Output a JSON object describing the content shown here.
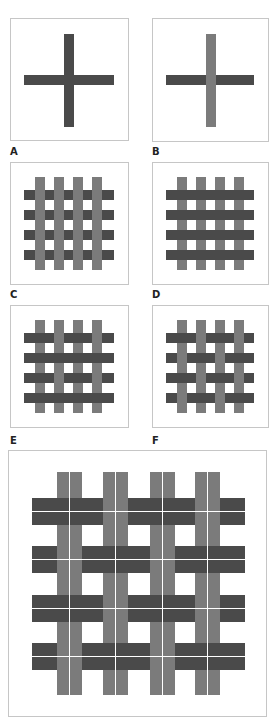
{
  "colors": {
    "dark": "#4a4a4a",
    "light": "#7b7b7b",
    "border": "#c6c6c6",
    "background": "#ffffff"
  },
  "panels": [
    {
      "id": "A",
      "label": "A",
      "box": [
        10,
        18,
        119,
        123
      ],
      "label_pos": [
        10,
        147
      ],
      "description": "single crossing, horizontal and vertical both dark",
      "verticals": [
        {
          "x": 64,
          "w": 10,
          "y": 34,
          "h": 93,
          "color": "dark"
        }
      ],
      "horizontals": [
        {
          "y": 75,
          "h": 10,
          "x": 24,
          "w": 90,
          "color": "dark"
        }
      ],
      "over": [
        [
          "dark-h"
        ]
      ]
    },
    {
      "id": "B",
      "label": "B",
      "box": [
        152,
        18,
        117,
        124
      ],
      "label_pos": [
        152,
        147
      ],
      "description": "single crossing, light vertical over dark horizontal",
      "verticals": [
        {
          "x": 206,
          "w": 10,
          "y": 34,
          "h": 93,
          "color": "light"
        }
      ],
      "horizontals": [
        {
          "y": 75,
          "h": 10,
          "x": 166,
          "w": 88,
          "color": "dark"
        }
      ],
      "over": [
        [
          "v"
        ]
      ]
    },
    {
      "id": "C",
      "label": "C",
      "box": [
        10,
        162,
        119,
        123
      ],
      "label_pos": [
        10,
        290
      ],
      "description": "4x4 grid, all light verticals over dark horizontals",
      "vx": [
        35,
        54,
        73,
        92
      ],
      "vw": 10,
      "vy": 177,
      "vh": 93,
      "hy": [
        190,
        210,
        230,
        250
      ],
      "hh": 10,
      "hx": 24,
      "hw": 90,
      "over": [
        [
          "v",
          "v",
          "v",
          "v"
        ],
        [
          "v",
          "v",
          "v",
          "v"
        ],
        [
          "v",
          "v",
          "v",
          "v"
        ],
        [
          "v",
          "v",
          "v",
          "v"
        ]
      ]
    },
    {
      "id": "D",
      "label": "D",
      "box": [
        152,
        162,
        117,
        123
      ],
      "label_pos": [
        152,
        290
      ],
      "description": "4x4 grid, all dark horizontals over light verticals",
      "vx": [
        177,
        196,
        215,
        234
      ],
      "vw": 10,
      "vy": 177,
      "vh": 93,
      "hy": [
        190,
        210,
        230,
        250
      ],
      "hh": 10,
      "hx": 166,
      "hw": 88,
      "over": [
        [
          "h",
          "h",
          "h",
          "h"
        ],
        [
          "h",
          "h",
          "h",
          "h"
        ],
        [
          "h",
          "h",
          "h",
          "h"
        ],
        [
          "h",
          "h",
          "h",
          "h"
        ]
      ]
    },
    {
      "id": "E",
      "label": "E",
      "box": [
        10,
        305,
        119,
        123
      ],
      "label_pos": [
        10,
        436
      ],
      "description": "4x4 grid, alternate rows interlace, other rows float over",
      "vx": [
        35,
        54,
        73,
        92
      ],
      "vw": 10,
      "vy": 320,
      "vh": 93,
      "hy": [
        333,
        353,
        373,
        393
      ],
      "hh": 10,
      "hx": 24,
      "hw": 90,
      "over": [
        [
          "h",
          "v",
          "h",
          "v"
        ],
        [
          "h",
          "h",
          "h",
          "h"
        ],
        [
          "h",
          "v",
          "h",
          "v"
        ],
        [
          "h",
          "h",
          "h",
          "h"
        ]
      ]
    },
    {
      "id": "F",
      "label": "F",
      "box": [
        152,
        305,
        117,
        123
      ],
      "label_pos": [
        152,
        436
      ],
      "description": "4x4 grid, plain weave",
      "vx": [
        177,
        196,
        215,
        234
      ],
      "vw": 10,
      "vy": 320,
      "vh": 93,
      "hy": [
        333,
        353,
        373,
        393
      ],
      "hh": 10,
      "hx": 166,
      "hw": 88,
      "over": [
        [
          "h",
          "v",
          "h",
          "v"
        ],
        [
          "v",
          "h",
          "v",
          "h"
        ],
        [
          "h",
          "v",
          "h",
          "v"
        ],
        [
          "v",
          "h",
          "v",
          "h"
        ]
      ]
    }
  ],
  "large_panel": {
    "id": "G",
    "box": [
      8,
      450,
      259,
      267
    ],
    "description": "basket weave, paired threads in plain weave pattern",
    "vx": [
      [
        57,
        12
      ],
      [
        70,
        12
      ],
      [
        103,
        12
      ],
      [
        116,
        12
      ],
      [
        150,
        12
      ],
      [
        163,
        12
      ],
      [
        195,
        12
      ],
      [
        208,
        12
      ]
    ],
    "vy": 472,
    "vh": 223,
    "hy": [
      [
        498,
        13
      ],
      [
        512,
        13
      ],
      [
        546,
        13
      ],
      [
        560,
        13
      ],
      [
        595,
        13
      ],
      [
        609,
        13
      ],
      [
        643,
        13
      ],
      [
        657,
        13
      ]
    ],
    "hx": 32,
    "hw": 213,
    "over": [
      [
        "h",
        "v",
        "h",
        "v"
      ],
      [
        "v",
        "h",
        "v",
        "h"
      ],
      [
        "h",
        "v",
        "h",
        "v"
      ],
      [
        "v",
        "h",
        "v",
        "h"
      ]
    ]
  }
}
